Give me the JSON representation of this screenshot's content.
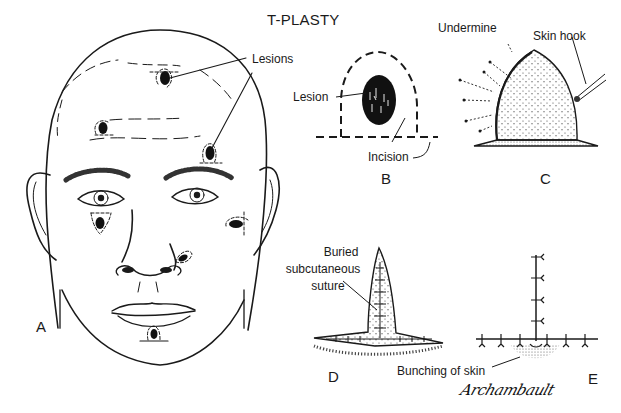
{
  "figure": {
    "title": "T-PLASTY",
    "signature": "Archambault",
    "colors": {
      "ink": "#1a1a1a",
      "background": "#ffffff",
      "stipple": "#555555"
    }
  },
  "panels": {
    "A": {
      "letter": "A",
      "callout": "Lesions"
    },
    "B": {
      "letter": "B",
      "lesion_label": "Lesion",
      "incision_label": "Incision"
    },
    "C": {
      "letter": "C",
      "undermine_label": "Undermine",
      "skin_hook_label": "Skin hook"
    },
    "D": {
      "letter": "D",
      "suture_label_line1": "Buried",
      "suture_label_line2": "subcutaneous",
      "suture_label_line3": "suture"
    },
    "E": {
      "letter": "E",
      "bunching_label": "Bunching of skin"
    }
  }
}
